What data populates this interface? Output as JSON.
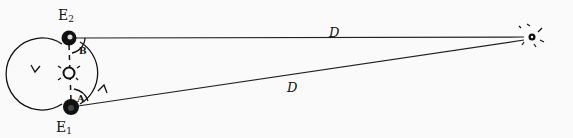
{
  "diagram": {
    "type": "stellar-parallax",
    "background": "#fafafa",
    "ink": "#111111",
    "labels": {
      "earth_top": "E",
      "earth_top_sub": "2",
      "earth_bottom": "E",
      "earth_bottom_sub": "1",
      "angle_top": "B",
      "angle_bottom": "A",
      "distance_top": "D",
      "distance_bottom": "D"
    },
    "nodes": [
      {
        "id": "earth-2",
        "kind": "planet",
        "x": 69,
        "y": 38
      },
      {
        "id": "sun",
        "kind": "sun",
        "x": 69,
        "y": 73
      },
      {
        "id": "earth-1",
        "kind": "planet",
        "x": 71,
        "y": 107
      },
      {
        "id": "star",
        "kind": "star",
        "x": 532,
        "y": 37
      }
    ],
    "edges": [
      {
        "from": "earth-2",
        "to": "star",
        "label": "D"
      },
      {
        "from": "earth-1",
        "to": "star",
        "label": "D"
      }
    ]
  }
}
